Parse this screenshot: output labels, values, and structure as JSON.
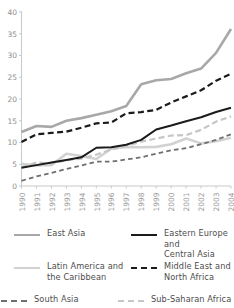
{
  "chart_data": {
    "type": "line",
    "title": "",
    "subtitle": "",
    "xlabel": "",
    "ylabel": "",
    "xlim": [
      1990,
      2004
    ],
    "ylim": [
      0,
      40
    ],
    "grid": false,
    "legend_position": "bottom",
    "x": [
      1990,
      1991,
      1992,
      1993,
      1994,
      1995,
      1996,
      1997,
      1998,
      1999,
      2000,
      2001,
      2002,
      2003,
      2004
    ],
    "xtick_labels": [
      "1990",
      "1991",
      "1992",
      "1993",
      "1994",
      "1995",
      "1996",
      "1997",
      "1998",
      "1999",
      "2000",
      "2001",
      "2002",
      "2003",
      "2004"
    ],
    "ytick_labels": [
      "0",
      "5",
      "10",
      "15",
      "20",
      "25",
      "30",
      "35",
      "40"
    ],
    "ytick_values": [
      0,
      5,
      10,
      15,
      20,
      25,
      30,
      35,
      40
    ],
    "series": [
      {
        "name": "East Asia",
        "color": "#a8a8a8",
        "style": "solid",
        "width": 2.6,
        "values": [
          12.4,
          13.8,
          13.6,
          15.0,
          15.6,
          16.4,
          17.2,
          18.4,
          23.4,
          24.3,
          24.6,
          25.9,
          27.0,
          30.6,
          36.1
        ]
      },
      {
        "name": "Eastern Europe and Central Asia",
        "color": "#1b1b1b",
        "style": "solid",
        "width": 2.0,
        "values": [
          4.2,
          4.8,
          5.4,
          6.0,
          6.6,
          8.8,
          8.9,
          9.5,
          10.6,
          13.0,
          13.9,
          14.9,
          15.8,
          17.0,
          18.0
        ]
      },
      {
        "name": "Latin America and the Caribbean",
        "color": "#d2d2d2",
        "style": "solid",
        "width": 2.6,
        "values": [
          5.1,
          4.7,
          4.8,
          7.4,
          6.9,
          6.2,
          8.6,
          9.0,
          8.9,
          9.0,
          9.6,
          10.9,
          9.8,
          10.3,
          11.1
        ]
      },
      {
        "name": "Middle East and North Africa",
        "color": "#1b1b1b",
        "style": "dashed",
        "width": 2.2,
        "values": [
          10.1,
          11.9,
          12.2,
          12.5,
          13.4,
          14.4,
          14.6,
          16.7,
          17.0,
          17.5,
          19.2,
          20.6,
          22.0,
          24.2,
          25.8
        ]
      },
      {
        "name": "South Asia",
        "color": "#6f6f6f",
        "style": "dashed",
        "width": 1.8,
        "values": [
          1.2,
          2.2,
          3.0,
          3.9,
          4.7,
          5.6,
          5.6,
          6.1,
          6.6,
          7.4,
          8.2,
          8.7,
          9.6,
          10.6,
          11.9
        ]
      },
      {
        "name": "Sub-Saharan Africa",
        "color": "#c6c6c6",
        "style": "dashed",
        "width": 2.2,
        "values": [
          4.3,
          5.4,
          5.2,
          5.9,
          6.3,
          7.2,
          8.4,
          9.2,
          10.2,
          10.9,
          11.6,
          11.7,
          12.9,
          14.8,
          16.0
        ]
      }
    ]
  },
  "legend": {
    "items": [
      {
        "label": "East Asia",
        "series": "East Asia"
      },
      {
        "label": "Eastern Europe and\nCentral Asia",
        "series": "Eastern Europe and Central Asia"
      },
      {
        "label": "Latin America and\nthe Caribbean",
        "series": "Latin America and the Caribbean"
      },
      {
        "label": "Middle East and\nNorth Africa",
        "series": "Middle East and North Africa"
      },
      {
        "label": "South Asia",
        "series": "South Asia"
      },
      {
        "label": "Sub-Saharan Africa",
        "series": "Sub-Saharan Africa"
      }
    ]
  },
  "axis": {
    "axis_color": "#c9c9c9"
  }
}
